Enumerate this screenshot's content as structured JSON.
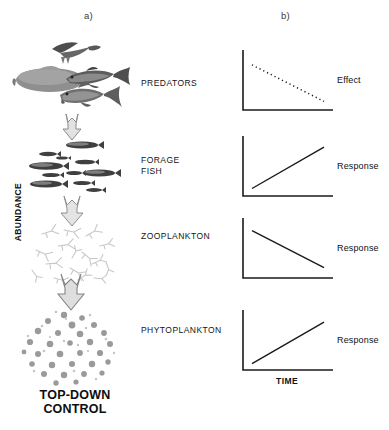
{
  "figure": {
    "panels": [
      {
        "letter": "a)"
      },
      {
        "letter": "b)"
      }
    ]
  },
  "food_web": {
    "levels": [
      {
        "name": "predators",
        "label": "PREDATORS",
        "organisms": "seabird, large fish, tuna, shark",
        "shade": "dark-grey"
      },
      {
        "name": "forage-fish",
        "label": "FORAGE\nFISH",
        "organisms": "school of small fish",
        "shade": "dark-grey"
      },
      {
        "name": "zooplankton",
        "label": "ZOOPLANKTON",
        "organisms": "copepod cluster",
        "shade": "light-grey"
      },
      {
        "name": "phytoplankton",
        "label": "PHYTOPLANKTON",
        "organisms": "round cell cluster",
        "shade": "mid-grey"
      }
    ],
    "arrows": [
      {
        "from": "predators",
        "to": "forage-fish",
        "direction": "down"
      },
      {
        "from": "forage-fish",
        "to": "zooplankton",
        "direction": "down"
      },
      {
        "from": "zooplankton",
        "to": "phytoplankton",
        "direction": "down"
      }
    ],
    "caption": "TOP-DOWN\nCONTROL"
  },
  "chart_data": [
    {
      "type": "line",
      "name": "predators-effect",
      "title": "",
      "xlabel": "",
      "ylabel": "ABUNDANCE",
      "label": "Effect",
      "linestyle": "dotted",
      "trend": "decreasing",
      "x": [
        0,
        1
      ],
      "y": [
        0.78,
        0.12
      ],
      "xlim": [
        0,
        1
      ],
      "ylim": [
        0,
        1
      ],
      "grid": false,
      "color": "#1a1a1a"
    },
    {
      "type": "line",
      "name": "forage-fish-response",
      "title": "",
      "xlabel": "",
      "ylabel": "ABUNDANCE",
      "label": "Response",
      "linestyle": "solid",
      "trend": "increasing",
      "x": [
        0,
        1
      ],
      "y": [
        0.1,
        0.85
      ],
      "xlim": [
        0,
        1
      ],
      "ylim": [
        0,
        1
      ],
      "grid": false,
      "color": "#1a1a1a"
    },
    {
      "type": "line",
      "name": "zooplankton-response",
      "title": "",
      "xlabel": "",
      "ylabel": "ABUNDANCE",
      "label": "Response",
      "linestyle": "solid",
      "trend": "decreasing",
      "x": [
        0,
        1
      ],
      "y": [
        0.82,
        0.15
      ],
      "xlim": [
        0,
        1
      ],
      "ylim": [
        0,
        1
      ],
      "grid": false,
      "color": "#1a1a1a"
    },
    {
      "type": "line",
      "name": "phytoplankton-response",
      "title": "",
      "xlabel": "",
      "ylabel": "ABUNDANCE",
      "label": "Response",
      "linestyle": "solid",
      "trend": "increasing",
      "x": [
        0,
        1
      ],
      "y": [
        0.08,
        0.83
      ],
      "xlim": [
        0,
        1
      ],
      "ylim": [
        0,
        1
      ],
      "grid": false,
      "color": "#1a1a1a"
    }
  ],
  "axes": {
    "y_label": "ABUNDANCE",
    "x_label": "TIME"
  }
}
